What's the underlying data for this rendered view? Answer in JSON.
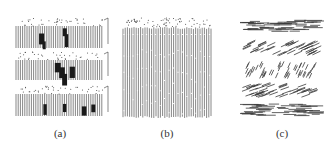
{
  "figure": {
    "panels": [
      {
        "id": "a",
        "label": "(a)",
        "description": "Three stacked layers of vertical fibers with speckled top surfaces and dark clusters"
      },
      {
        "id": "b",
        "label": "(b)",
        "description": "Single block of vertically aligned fibers with speckled top surface"
      },
      {
        "id": "c",
        "label": "(c)",
        "description": "Five stacked layers of short fibers with varying orientations (horizontal, diagonal, steep diagonal, diagonal, horizontal)"
      }
    ]
  },
  "colors": {
    "ink": "#3a3a3a",
    "dark": "#1a1a1a",
    "background": "#ffffff"
  }
}
